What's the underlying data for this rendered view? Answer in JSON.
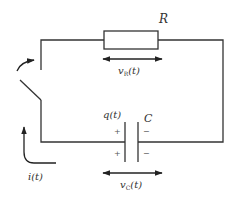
{
  "diagram": {
    "type": "RC circuit with switch",
    "stroke_color": "#333333",
    "background": "#ffffff",
    "resistor": {
      "label": "R",
      "voltage_label": "v",
      "voltage_sub": "R",
      "voltage_arg": "(t)"
    },
    "capacitor": {
      "label": "C",
      "charge_label": "q(t)",
      "voltage_label": "v",
      "voltage_sub": "C",
      "voltage_arg": "(t)",
      "left_signs": [
        "+",
        "+"
      ],
      "right_signs": [
        "−",
        "−"
      ]
    },
    "current": {
      "label": "i(t)"
    },
    "switch": {
      "state": "open",
      "action_arrow": "closing"
    }
  }
}
